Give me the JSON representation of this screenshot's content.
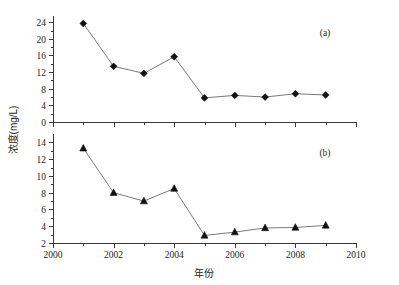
{
  "figure": {
    "xlabel": "年份",
    "ylabel": "浓度(mg/L)",
    "panel_a_label": "(a)",
    "panel_b_label": "(b)",
    "line_color": "#7a7a7a",
    "marker_color": "#111111",
    "axis_color": "#3a3a3a"
  },
  "chart_data": [
    {
      "type": "line",
      "title": "",
      "subtitle": "(a)",
      "panel": "a",
      "marker": "diamond",
      "xlabel": "年份",
      "ylabel": "浓度(mg/L)",
      "x": [
        2001,
        2002,
        2003,
        2004,
        2005,
        2006,
        2007,
        2008,
        2009
      ],
      "values": [
        23.7,
        13.4,
        11.7,
        15.7,
        5.8,
        6.4,
        6.0,
        6.8,
        6.5
      ],
      "xlim": [
        2000,
        2010
      ],
      "ylim": [
        0,
        25.5
      ],
      "xticks": [
        2000,
        2002,
        2004,
        2006,
        2008,
        2010
      ],
      "xtick_labels": [
        "2000",
        "2002",
        "2004",
        "2006",
        "2008",
        "2010"
      ],
      "xminor_ticks": [
        2001,
        2003,
        2005,
        2007,
        2009
      ],
      "yticks": [
        0,
        4,
        8,
        12,
        16,
        20,
        24
      ],
      "ytick_labels": [
        "0",
        "4",
        "8",
        "12",
        "16",
        "20",
        "24"
      ],
      "yminor_ticks": [
        2,
        6,
        10,
        14,
        18,
        22
      ],
      "grid": false,
      "legend": "none"
    },
    {
      "type": "line",
      "title": "",
      "subtitle": "(b)",
      "panel": "b",
      "marker": "triangle",
      "xlabel": "年份",
      "ylabel": "浓度(mg/L)",
      "x": [
        2001,
        2002,
        2003,
        2004,
        2005,
        2006,
        2007,
        2008,
        2009
      ],
      "values": [
        13.3,
        8.0,
        7.0,
        8.5,
        2.9,
        3.3,
        3.8,
        3.85,
        4.1
      ],
      "xlim": [
        2000,
        2010
      ],
      "ylim": [
        2,
        15
      ],
      "xticks": [
        2000,
        2002,
        2004,
        2006,
        2008,
        2010
      ],
      "xtick_labels": [
        "2000",
        "2002",
        "2004",
        "2006",
        "2008",
        "2010"
      ],
      "xminor_ticks": [
        2001,
        2003,
        2005,
        2007,
        2009
      ],
      "yticks": [
        2,
        4,
        6,
        8,
        10,
        12,
        14
      ],
      "ytick_labels": [
        "2",
        "4",
        "6",
        "8",
        "10",
        "12",
        "14"
      ],
      "yminor_ticks": [
        3,
        5,
        7,
        9,
        11,
        13
      ],
      "grid": false,
      "legend": "none"
    }
  ]
}
